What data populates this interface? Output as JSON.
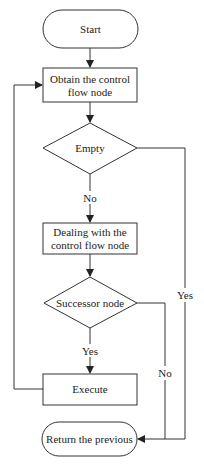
{
  "diagram": {
    "type": "flowchart",
    "nodes": {
      "start": {
        "shape": "terminator",
        "label": "Start"
      },
      "obtain": {
        "shape": "process",
        "line1": "Obtain the control",
        "line2": "flow node"
      },
      "empty": {
        "shape": "decision",
        "label": "Empty"
      },
      "dealing": {
        "shape": "process",
        "line1": "Dealing with the",
        "line2": "control flow node"
      },
      "successor": {
        "shape": "decision",
        "label": "Successor node"
      },
      "execute": {
        "shape": "process",
        "label": "Execute"
      },
      "return": {
        "shape": "terminator",
        "label": "Return the previous"
      }
    },
    "edge_labels": {
      "empty_no": "No",
      "empty_yes": "Yes",
      "successor_yes": "Yes",
      "successor_no": "No"
    },
    "edges": [
      {
        "from": "start",
        "to": "obtain"
      },
      {
        "from": "obtain",
        "to": "empty"
      },
      {
        "from": "empty",
        "to": "dealing",
        "label": "No"
      },
      {
        "from": "empty",
        "to": "return",
        "label": "Yes"
      },
      {
        "from": "dealing",
        "to": "successor"
      },
      {
        "from": "successor",
        "to": "execute",
        "label": "Yes"
      },
      {
        "from": "successor",
        "to": "return",
        "label": "No"
      },
      {
        "from": "execute",
        "to": "obtain"
      }
    ],
    "colors": {
      "stroke": "#333333",
      "background": "#ffffff",
      "text": "#222222"
    }
  }
}
